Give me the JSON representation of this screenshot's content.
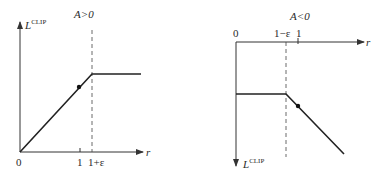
{
  "panels": [
    {
      "id": "positive",
      "condition": "A>0",
      "y_axis_label": "L",
      "y_axis_sup": "CLIP",
      "x_axis_label": "r",
      "origin_label": "0",
      "ticks": [
        "1",
        "1+ε"
      ],
      "description": "Linear increase from origin until r = 1+ε, then flat (clipped)"
    },
    {
      "id": "negative",
      "condition": "A<0",
      "y_axis_label": "L",
      "y_axis_sup": "CLIP",
      "x_axis_label": "r",
      "origin_label": "0",
      "ticks": [
        "1−ε",
        "1"
      ],
      "description": "Flat (clipped) until r = 1−ε, then linear decrease"
    }
  ],
  "colors": {
    "line": "#222222",
    "axis": "#333333",
    "dashed": "#444444"
  }
}
